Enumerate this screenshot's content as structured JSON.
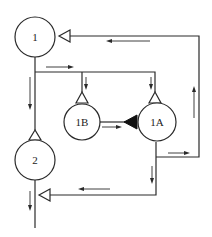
{
  "diagram": {
    "type": "flow network diagram",
    "colors": {
      "stroke": "#2a2a2a",
      "background": "#ffffff"
    },
    "nodes": [
      {
        "id": "1",
        "label": "1"
      },
      {
        "id": "1B",
        "label": "1B"
      },
      {
        "id": "1A",
        "label": "1A"
      },
      {
        "id": "2",
        "label": "2"
      }
    ],
    "connectors": [
      {
        "symbol": "open-triangle",
        "location": "right of node 1, inlet from return loop"
      },
      {
        "symbol": "open-triangle",
        "location": "top of node 1B, inlet"
      },
      {
        "symbol": "open-triangle",
        "location": "top of node 1A, inlet"
      },
      {
        "symbol": "filled-triangle",
        "location": "between 1B and 1A, inlet to 1A"
      },
      {
        "symbol": "open-triangle",
        "location": "top of node 2, inlet"
      },
      {
        "symbol": "open-triangle",
        "location": "right of node 2, inlet from 1A"
      }
    ],
    "flows": [
      {
        "from": "1",
        "to": "2",
        "direction": "down"
      },
      {
        "from": "1",
        "to": "1B",
        "direction": "right then down"
      },
      {
        "from": "1",
        "to": "1A",
        "direction": "right then down"
      },
      {
        "from": "1B",
        "to": "1A",
        "direction": "right"
      },
      {
        "from": "1A",
        "to": "1",
        "direction": "right, up, left (return loop)"
      },
      {
        "from": "1A",
        "to": "2",
        "direction": "down then left"
      },
      {
        "from": "2",
        "to": "out",
        "direction": "down"
      }
    ]
  }
}
